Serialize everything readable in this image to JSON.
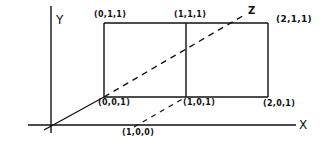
{
  "diagram": {
    "axes": {
      "y_label": "Y",
      "x_label": "X",
      "z_label": "Z"
    },
    "points": {
      "p011": "(0,1,1)",
      "p111": "(1,1,1)",
      "p211": "(2,1,1)",
      "p001": "(0,0,1)",
      "p101": "(1,0,1)",
      "p201": "(2,0,1)",
      "p100": "(1,0,0)"
    },
    "colors": {
      "ink": "#111111",
      "background": "#ffffff"
    }
  }
}
